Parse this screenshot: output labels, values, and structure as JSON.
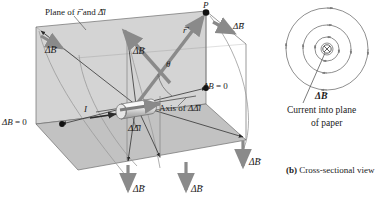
{
  "figure": {
    "panel_a": {
      "plane_label": "Plane of",
      "plane_label_r": "r",
      "plane_label_and": "and",
      "plane_label_dl": "Δl",
      "point_P": "P",
      "r_vector": "r",
      "theta": "θ",
      "current_label": "I",
      "dl_label": "Δl",
      "axis_label": "Axis of",
      "axis_label_dl": "Δl",
      "zero_left": "ΔB = 0",
      "zero_right": "ΔB = 0",
      "dB_labels": [
        {
          "name": "dB-top-right",
          "text": "ΔB"
        },
        {
          "name": "dB-center",
          "text": "ΔB"
        },
        {
          "name": "dB-left",
          "text": "ΔB"
        },
        {
          "name": "dB-bottom-left",
          "text": "ΔB"
        },
        {
          "name": "dB-bottom-center",
          "text": "ΔB"
        },
        {
          "name": "dB-right",
          "text": "ΔB"
        }
      ]
    },
    "panel_b": {
      "caption_tag": "(b)",
      "caption_text": "Cross-sectional view",
      "dB_label": "ΔB",
      "current_note_line1": "Current into plane",
      "current_note_line2": "of paper"
    },
    "colors": {
      "plane_fill": "#d4d4d4",
      "floor_fill": "#c2c2c2",
      "vector_gray": "#8a8a8a",
      "line_dark": "#2b2b2b",
      "arc_gray": "#9a9a9a",
      "ink": "#1a1a1a"
    }
  }
}
